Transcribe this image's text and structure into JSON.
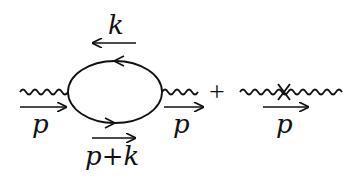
{
  "diagram": {
    "type": "feynman-diagram",
    "colors": {
      "ink": "#111111",
      "background": "#ffffff"
    },
    "term1": {
      "loop_top_momentum": "k",
      "loop_bottom_momentum": "p+k",
      "incoming_momentum": "p",
      "outgoing_momentum": "p"
    },
    "operator": "+",
    "term2": {
      "momentum": "p",
      "vertex_marker": "cross"
    }
  }
}
